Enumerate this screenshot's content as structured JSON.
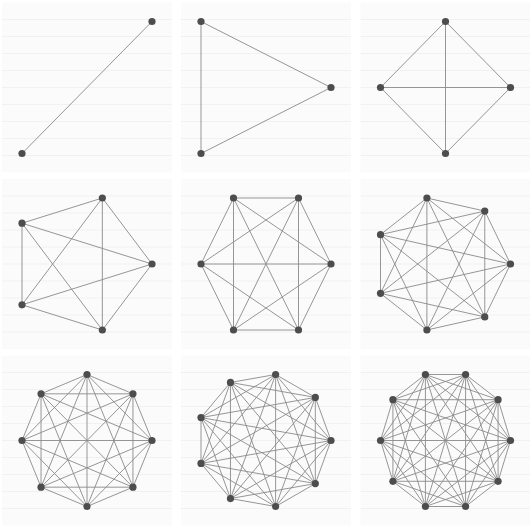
{
  "figure": {
    "layout": "3x3 grid of circular layouts",
    "colors": {
      "background": "#ffffff",
      "panel_background": "#fbfbfb",
      "gridline": "#f1f1f1",
      "edge": "#8a8a8a",
      "node": "#4d4d4d"
    },
    "node_radius": 3.6,
    "half_width": 65,
    "half_height": 66,
    "panels": [
      {
        "name": "K2",
        "n": 2,
        "cx": 87,
        "cy": 87.5
      },
      {
        "name": "K3",
        "n": 3,
        "cx": 266,
        "cy": 87.5
      },
      {
        "name": "K4",
        "n": 4,
        "cx": 445.5,
        "cy": 87.5
      },
      {
        "name": "K5",
        "n": 5,
        "cx": 87,
        "cy": 264
      },
      {
        "name": "K6",
        "n": 6,
        "cx": 266,
        "cy": 264
      },
      {
        "name": "K7",
        "n": 7,
        "cx": 445.5,
        "cy": 264
      },
      {
        "name": "K8",
        "n": 8,
        "cx": 87,
        "cy": 440.5
      },
      {
        "name": "K9",
        "n": 9,
        "cx": 266,
        "cy": 440.5
      },
      {
        "name": "K10",
        "n": 10,
        "cx": 445.5,
        "cy": 440.5
      }
    ]
  }
}
